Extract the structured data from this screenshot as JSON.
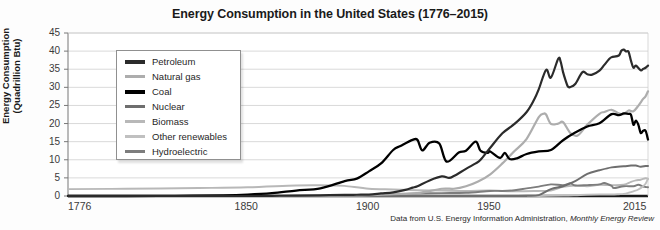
{
  "chart_data": {
    "type": "line",
    "title": "Energy Consumption in the United States (1776–2015)",
    "xlabel": "",
    "ylabel": "Energy Consumption (Quadrillion Btu)",
    "ylabel_line1": "Energy Consumption",
    "ylabel_line2": "(Quadrillion Btu)",
    "xlim": [
      1776,
      2015
    ],
    "ylim": [
      0,
      45
    ],
    "yticks": [
      0,
      5,
      10,
      15,
      20,
      25,
      30,
      35,
      40,
      45
    ],
    "ytick_labels": [
      "0",
      "5",
      "10",
      "15",
      "20",
      "25",
      "30",
      "35",
      "40",
      "45"
    ],
    "xticks": [
      1776,
      1850,
      1900,
      1950,
      2015
    ],
    "xtick_labels": [
      "1776",
      "1850",
      "1900",
      "1950",
      "2015"
    ],
    "grid": "horizontal",
    "legend_position": "upper-left-inside",
    "source_note": "Data from U.S. Energy Information Administration, ",
    "source_note_italic": "Monthly Energy Review",
    "series": [
      {
        "name": "Petroleum",
        "color": "#2b2b2b",
        "width": 2.2,
        "x": [
          1776,
          1850,
          1860,
          1870,
          1880,
          1890,
          1895,
          1900,
          1905,
          1910,
          1915,
          1918,
          1920,
          1925,
          1930,
          1933,
          1935,
          1940,
          1944,
          1946,
          1950,
          1955,
          1960,
          1965,
          1968,
          1970,
          1973,
          1975,
          1978,
          1979,
          1980,
          1981,
          1982,
          1983,
          1985,
          1988,
          1990,
          1992,
          1995,
          1997,
          1999,
          2000,
          2003,
          2004,
          2005,
          2006,
          2007,
          2008,
          2009,
          2010,
          2012,
          2013,
          2014,
          2015
        ],
        "y": [
          0.0,
          0.0,
          0.05,
          0.1,
          0.2,
          0.3,
          0.35,
          0.4,
          0.7,
          1.0,
          1.7,
          2.3,
          2.7,
          4.3,
          5.4,
          5.0,
          5.5,
          7.5,
          9.0,
          10.0,
          13.3,
          17.3,
          19.9,
          23.2,
          26.5,
          29.5,
          34.8,
          32.7,
          37.9,
          37.1,
          34.2,
          32.0,
          30.2,
          30.1,
          30.9,
          34.2,
          33.6,
          33.5,
          34.6,
          36.2,
          37.8,
          38.3,
          38.8,
          40.1,
          40.4,
          39.9,
          39.8,
          37.3,
          35.4,
          36.0,
          34.7,
          35.1,
          35.4,
          36.0
        ]
      },
      {
        "name": "Natural gas",
        "color": "#adadad",
        "width": 2.2,
        "x": [
          1776,
          1850,
          1880,
          1890,
          1900,
          1910,
          1920,
          1930,
          1935,
          1940,
          1945,
          1950,
          1955,
          1960,
          1965,
          1970,
          1972,
          1973,
          1975,
          1978,
          1980,
          1983,
          1986,
          1990,
          1995,
          1997,
          2000,
          2003,
          2005,
          2007,
          2009,
          2011,
          2013,
          2014,
          2015
        ],
        "y": [
          0.0,
          0.0,
          0.05,
          0.15,
          0.25,
          0.5,
          0.8,
          2.0,
          2.0,
          2.7,
          4.0,
          6.0,
          9.0,
          12.4,
          15.8,
          21.8,
          22.7,
          22.5,
          19.9,
          20.0,
          20.4,
          17.4,
          16.7,
          19.7,
          22.7,
          23.2,
          23.8,
          22.8,
          22.6,
          23.6,
          23.4,
          24.9,
          26.8,
          27.5,
          28.9
        ]
      },
      {
        "name": "Coal",
        "color": "#000000",
        "width": 2.3,
        "x": [
          1776,
          1800,
          1820,
          1840,
          1850,
          1860,
          1870,
          1880,
          1890,
          1895,
          1900,
          1905,
          1910,
          1913,
          1918,
          1920,
          1922,
          1925,
          1929,
          1932,
          1937,
          1940,
          1944,
          1946,
          1949,
          1950,
          1954,
          1956,
          1958,
          1961,
          1965,
          1970,
          1975,
          1980,
          1985,
          1990,
          1995,
          2000,
          2003,
          2005,
          2007,
          2008,
          2009,
          2010,
          2011,
          2012,
          2013,
          2014,
          2015
        ],
        "y": [
          0.0,
          0.0,
          0.05,
          0.2,
          0.4,
          0.8,
          1.5,
          2.1,
          4.1,
          4.8,
          6.8,
          9.0,
          12.7,
          13.8,
          15.5,
          15.5,
          12.6,
          14.7,
          14.5,
          9.5,
          12.0,
          12.5,
          15.0,
          12.5,
          11.9,
          12.3,
          10.5,
          11.9,
          10.2,
          10.4,
          11.6,
          12.3,
          12.7,
          15.4,
          17.5,
          19.2,
          20.1,
          22.6,
          22.3,
          22.8,
          22.7,
          22.4,
          19.7,
          20.8,
          19.7,
          17.4,
          18.0,
          18.0,
          15.6
        ]
      },
      {
        "name": "Nuclear",
        "color": "#6e6e6e",
        "width": 2.0,
        "x": [
          1776,
          1950,
          1957,
          1960,
          1965,
          1970,
          1975,
          1980,
          1985,
          1990,
          1995,
          2000,
          2005,
          2008,
          2010,
          2012,
          2014,
          2015
        ],
        "y": [
          0.0,
          0.0,
          0.0,
          0.01,
          0.04,
          0.24,
          1.9,
          2.7,
          4.1,
          6.1,
          7.1,
          7.9,
          8.2,
          8.4,
          8.4,
          8.1,
          8.3,
          8.3
        ]
      },
      {
        "name": "Biomass",
        "color": "#b8b8b8",
        "width": 1.9,
        "x": [
          1776,
          1800,
          1830,
          1850,
          1870,
          1880,
          1885,
          1890,
          1900,
          1910,
          1920,
          1930,
          1940,
          1950,
          1960,
          1970,
          1975,
          1980,
          1985,
          1990,
          1995,
          2000,
          2005,
          2008,
          2010,
          2012,
          2014,
          2015
        ],
        "y": [
          1.9,
          2.0,
          2.2,
          2.4,
          2.9,
          2.95,
          2.9,
          2.8,
          2.0,
          1.8,
          1.6,
          1.5,
          1.4,
          1.5,
          1.3,
          1.4,
          1.5,
          2.5,
          2.9,
          2.7,
          3.1,
          3.0,
          3.1,
          3.9,
          4.3,
          4.5,
          4.9,
          4.7
        ]
      },
      {
        "name": "Other renewables",
        "color": "#c0c0c0",
        "width": 1.9,
        "x": [
          1776,
          1900,
          1950,
          1960,
          1970,
          1980,
          1985,
          1990,
          1995,
          2000,
          2003,
          2005,
          2007,
          2009,
          2011,
          2013,
          2014,
          2015
        ],
        "y": [
          0.0,
          0.0,
          0.0,
          0.0,
          0.0,
          0.1,
          0.2,
          0.35,
          0.4,
          0.4,
          0.5,
          0.6,
          0.9,
          1.3,
          1.8,
          2.7,
          3.4,
          4.8
        ]
      },
      {
        "name": "Hydroelectric",
        "color": "#7d7d7d",
        "width": 1.9,
        "x": [
          1776,
          1880,
          1890,
          1900,
          1910,
          1920,
          1930,
          1940,
          1950,
          1955,
          1960,
          1965,
          1970,
          1975,
          1980,
          1983,
          1985,
          1990,
          1995,
          1997,
          2000,
          2001,
          2005,
          2009,
          2011,
          2013,
          2014,
          2015
        ],
        "y": [
          0.0,
          0.0,
          0.1,
          0.25,
          0.5,
          0.7,
          0.8,
          0.9,
          1.4,
          1.4,
          1.6,
          2.1,
          2.6,
          3.2,
          3.0,
          3.5,
          2.9,
          3.0,
          3.2,
          3.6,
          2.8,
          2.2,
          2.7,
          2.7,
          3.1,
          2.6,
          2.5,
          2.4
        ]
      }
    ]
  },
  "legend": {
    "items": [
      {
        "label": "Petroleum",
        "color": "#2b2b2b"
      },
      {
        "label": "Natural gas",
        "color": "#adadad"
      },
      {
        "label": "Coal",
        "color": "#000000"
      },
      {
        "label": "Nuclear",
        "color": "#6e6e6e"
      },
      {
        "label": "Biomass",
        "color": "#b8b8b8"
      },
      {
        "label": "Other renewables",
        "color": "#c0c0c0"
      },
      {
        "label": "Hydroelectric",
        "color": "#7d7d7d"
      }
    ]
  }
}
